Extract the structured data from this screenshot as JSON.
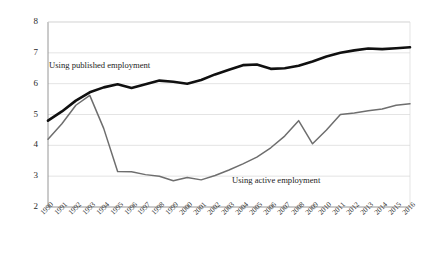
{
  "chart_data": {
    "type": "line",
    "title": "",
    "subtitle": "",
    "xlabel": "",
    "ylabel": "",
    "xlim": [
      1990,
      2016
    ],
    "ylim": [
      2,
      8
    ],
    "grid": "horizontal",
    "legend_position": "inline-annotations",
    "x": [
      1990,
      1991,
      1992,
      1993,
      1994,
      1995,
      1996,
      1997,
      1998,
      1999,
      2000,
      2001,
      2002,
      2003,
      2004,
      2005,
      2006,
      2007,
      2008,
      2009,
      2010,
      2011,
      2012,
      2013,
      2014,
      2015,
      2016
    ],
    "categories": [
      "1990",
      "1991",
      "1992",
      "1993",
      "1994",
      "1995",
      "1996",
      "1997",
      "1998",
      "1999",
      "2000",
      "2001",
      "2002",
      "2003",
      "2004",
      "2005",
      "2006",
      "2007",
      "2008",
      "2009",
      "2010",
      "2011",
      "2012",
      "2013",
      "2014",
      "2015",
      "2016"
    ],
    "ytick_labels": [
      "8",
      "7",
      "6",
      "5",
      "4",
      "3",
      "2"
    ],
    "yticks": [
      8,
      7,
      6,
      5,
      4,
      3,
      2
    ],
    "series": [
      {
        "name": "Using published employment",
        "color": "#101010",
        "width": 2.6,
        "values": [
          4.8,
          5.1,
          5.45,
          5.72,
          5.88,
          5.98,
          5.86,
          5.98,
          6.1,
          6.06,
          6.0,
          6.12,
          6.3,
          6.45,
          6.6,
          6.62,
          6.48,
          6.5,
          6.58,
          6.72,
          6.88,
          7.0,
          7.08,
          7.14,
          7.12,
          7.15,
          7.18
        ]
      },
      {
        "name": "Using active employment",
        "color": "#6e6e6e",
        "width": 1.5,
        "values": [
          4.2,
          4.7,
          5.3,
          5.62,
          4.55,
          3.15,
          3.14,
          3.05,
          3.0,
          2.85,
          2.96,
          2.88,
          3.02,
          3.2,
          3.4,
          3.62,
          3.92,
          4.3,
          4.8,
          4.05,
          4.5,
          5.0,
          5.05,
          5.12,
          5.18,
          5.3,
          5.35
        ]
      }
    ],
    "annotations": [
      {
        "text": "Using published employment",
        "series": "Using published employment"
      },
      {
        "text": "Using active employment",
        "series": "Using active employment"
      }
    ]
  },
  "axes": {
    "y_axis_name": "value-axis",
    "x_axis_name": "year-axis"
  },
  "colors": {
    "background": "#ffffff",
    "grid": "#d8d8d8",
    "axis": "#8a8a8a",
    "published_line": "#101010",
    "active_line": "#6e6e6e"
  }
}
